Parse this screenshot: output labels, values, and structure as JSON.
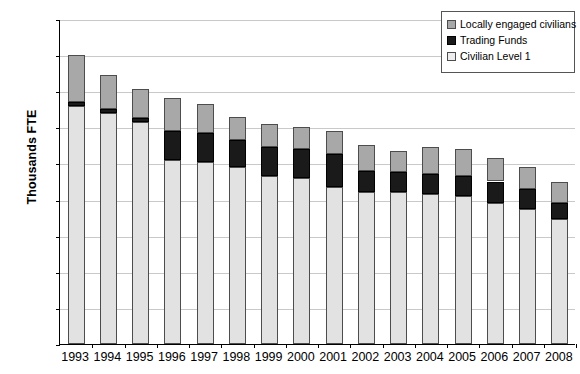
{
  "chart_data": {
    "type": "bar",
    "stacked": true,
    "title": "",
    "xlabel": "",
    "ylabel": "Thousands FTE",
    "ylim": [
      0,
      180
    ],
    "ytick_step": 20,
    "yticks": [
      0,
      20,
      40,
      60,
      80,
      100,
      120,
      140,
      160,
      180
    ],
    "grid": true,
    "legend_position": "top-right",
    "categories": [
      "1993",
      "1994",
      "1995",
      "1996",
      "1997",
      "1998",
      "1999",
      "2000",
      "2001",
      "2002",
      "2003",
      "2004",
      "2005",
      "2006",
      "2007",
      "2008"
    ],
    "series": [
      {
        "name": "Civilian Level 1",
        "color": "#e2e2e2",
        "values": [
          132,
          128,
          123,
          102,
          101,
          98,
          93,
          92,
          87,
          84,
          84,
          83,
          82,
          78,
          75,
          69
        ]
      },
      {
        "name": "Trading Funds",
        "color": "#1a1a1a",
        "values": [
          2,
          2,
          2,
          16,
          16,
          15,
          16,
          16,
          18,
          12,
          11,
          11,
          11,
          12,
          11,
          9
        ]
      },
      {
        "name": "Locally engaged civilians",
        "color": "#a8a8a8",
        "values": [
          26,
          19,
          16,
          18,
          16,
          13,
          13,
          12,
          13,
          14,
          12,
          15,
          15,
          13,
          12,
          12
        ]
      }
    ],
    "totals": [
      160,
      149,
      141,
      136,
      133,
      126,
      122,
      120,
      118,
      110,
      107,
      109,
      108,
      103,
      98,
      90
    ]
  },
  "legend": {
    "items": [
      {
        "label": "Locally engaged civilians",
        "swatch": "legend-swatch-gray"
      },
      {
        "label": "Trading Funds",
        "swatch": "legend-swatch-black"
      },
      {
        "label": "Civilian Level 1",
        "swatch": "legend-swatch-light"
      }
    ]
  },
  "axis": {
    "y_title": "Thousands FTE"
  }
}
